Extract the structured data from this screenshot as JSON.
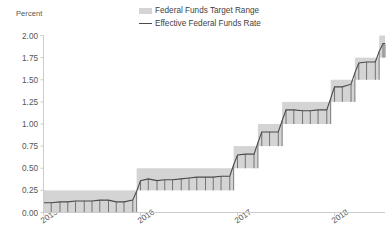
{
  "chart_data": {
    "type": "area",
    "title": "",
    "xlabel": "",
    "ylabel": "Percent",
    "ylim": [
      0.0,
      2.0
    ],
    "ytick_labels": [
      "0.00",
      "0.25",
      "0.50",
      "0.75",
      "1.00",
      "1.25",
      "1.50",
      "1.75",
      "2.00"
    ],
    "ytick_values": [
      0.0,
      0.25,
      0.5,
      0.75,
      1.0,
      1.25,
      1.5,
      1.75,
      2.0
    ],
    "xtick_labels": [
      "2015",
      "2016",
      "2017",
      "2018"
    ],
    "xtick_values": [
      2015.0,
      2016.0,
      2017.0,
      2018.0
    ],
    "xlim": [
      2015.0,
      2018.52
    ],
    "grid": false,
    "legend_position": "top-center",
    "colors": {
      "band": "#d4d4d4",
      "line": "#4a4a4a",
      "axis": "#cccccc",
      "text": "#555555"
    },
    "series": [
      {
        "name": "Federal Funds Target Range",
        "type": "band",
        "steps": [
          {
            "start": 2015.0,
            "end": 2015.96,
            "lower": 0.0,
            "upper": 0.25
          },
          {
            "start": 2015.96,
            "end": 2016.96,
            "lower": 0.25,
            "upper": 0.5
          },
          {
            "start": 2016.96,
            "end": 2017.21,
            "lower": 0.5,
            "upper": 0.75
          },
          {
            "start": 2017.21,
            "end": 2017.46,
            "lower": 0.75,
            "upper": 1.0
          },
          {
            "start": 2017.46,
            "end": 2017.96,
            "lower": 1.0,
            "upper": 1.25
          },
          {
            "start": 2017.96,
            "end": 2018.21,
            "lower": 1.25,
            "upper": 1.5
          },
          {
            "start": 2018.21,
            "end": 2018.46,
            "lower": 1.5,
            "upper": 1.75
          },
          {
            "start": 2018.46,
            "end": 2018.52,
            "lower": 1.75,
            "upper": 2.0
          }
        ]
      },
      {
        "name": "Effective Federal Funds Rate",
        "type": "line",
        "x": [
          2015.0,
          2015.08,
          2015.17,
          2015.25,
          2015.33,
          2015.42,
          2015.5,
          2015.58,
          2015.67,
          2015.75,
          2015.83,
          2015.92,
          2015.96,
          2016.0,
          2016.08,
          2016.17,
          2016.25,
          2016.33,
          2016.42,
          2016.5,
          2016.58,
          2016.67,
          2016.75,
          2016.83,
          2016.92,
          2016.96,
          2017.0,
          2017.08,
          2017.17,
          2017.21,
          2017.25,
          2017.33,
          2017.42,
          2017.46,
          2017.5,
          2017.58,
          2017.67,
          2017.75,
          2017.83,
          2017.92,
          2017.96,
          2018.0,
          2018.08,
          2018.17,
          2018.21,
          2018.25,
          2018.33,
          2018.42,
          2018.46,
          2018.5,
          2018.52
        ],
        "y": [
          0.11,
          0.11,
          0.12,
          0.12,
          0.13,
          0.13,
          0.13,
          0.14,
          0.14,
          0.12,
          0.12,
          0.14,
          0.24,
          0.36,
          0.38,
          0.36,
          0.37,
          0.37,
          0.38,
          0.39,
          0.4,
          0.4,
          0.4,
          0.41,
          0.41,
          0.54,
          0.65,
          0.66,
          0.66,
          0.79,
          0.91,
          0.91,
          0.91,
          1.04,
          1.16,
          1.16,
          1.15,
          1.15,
          1.16,
          1.16,
          1.29,
          1.42,
          1.42,
          1.45,
          1.58,
          1.69,
          1.7,
          1.7,
          1.82,
          1.91,
          1.91
        ]
      }
    ]
  },
  "legend": {
    "items": [
      {
        "label": "Federal Funds Target Range",
        "swatch": "band"
      },
      {
        "label": "Effective Federal Funds Rate",
        "swatch": "line"
      }
    ]
  },
  "axis": {
    "y_title": "Percent"
  }
}
